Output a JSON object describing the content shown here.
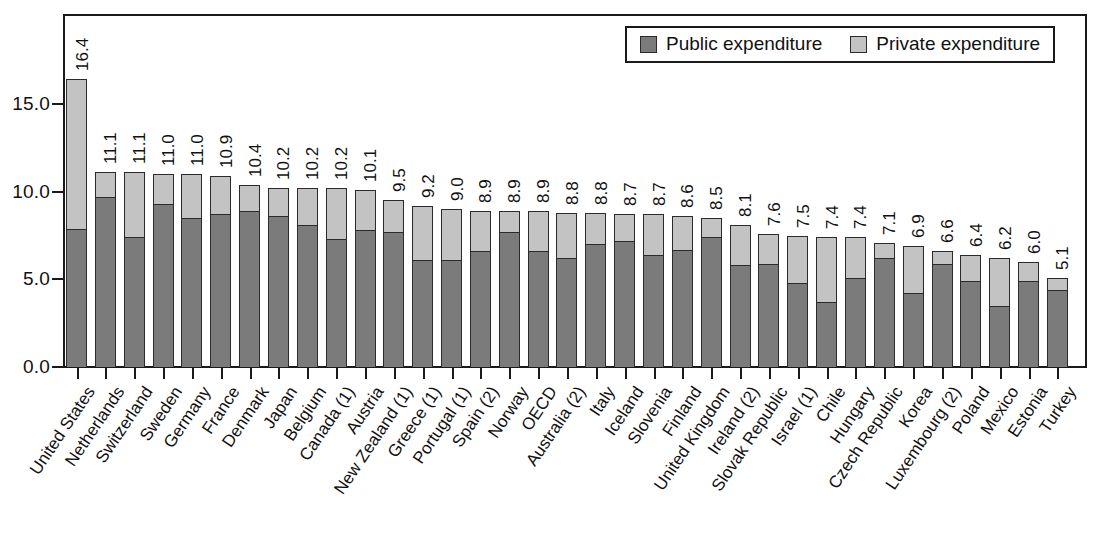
{
  "chart_data": {
    "type": "bar",
    "subtype": "stacked-vertical",
    "title": "",
    "xlabel": "",
    "ylabel": "",
    "ylim": [
      0,
      17.5
    ],
    "yticks": [
      "0.0",
      "5.0",
      "10.0",
      "15.0"
    ],
    "ytick_values": [
      0.0,
      5.0,
      10.0,
      15.0
    ],
    "grid": false,
    "legend_position": "top-right",
    "legend": [
      "Public expenditure",
      "Private expenditure"
    ],
    "colors": {
      "public": "#7b7b7b",
      "private": "#c3c3c3",
      "axis": "#1a1a1a",
      "text": "#111111",
      "background": "#ffffff"
    },
    "categories": [
      "United States",
      "Netherlands",
      "Switzerland",
      "Sweden",
      "Germany",
      "France",
      "Denmark",
      "Japan",
      "Belgium",
      "Canada (1)",
      "Austria",
      "New Zealand (1)",
      "Greece (1)",
      "Portugal (1)",
      "Spain (2)",
      "Norway",
      "OECD",
      "Australia (2)",
      "Italy",
      "Iceland",
      "Slovenia",
      "Finland",
      "United Kingdom",
      "Ireland (2)",
      "Slovak Republic",
      "Israel (1)",
      "Chile",
      "Hungary",
      "Czech Republic",
      "Korea",
      "Luxembourg (2)",
      "Poland",
      "Mexico",
      "Estonia",
      "Turkey"
    ],
    "totals": [
      16.4,
      11.1,
      11.1,
      11.0,
      11.0,
      10.9,
      10.4,
      10.2,
      10.2,
      10.2,
      10.1,
      9.5,
      9.2,
      9.0,
      8.9,
      8.9,
      8.9,
      8.8,
      8.8,
      8.7,
      8.7,
      8.6,
      8.5,
      8.1,
      7.6,
      7.5,
      7.4,
      7.4,
      7.1,
      6.9,
      6.6,
      6.4,
      6.2,
      6.0,
      5.1
    ],
    "series": [
      {
        "name": "Public expenditure",
        "values": [
          7.9,
          9.7,
          7.4,
          9.3,
          8.5,
          8.7,
          8.9,
          8.6,
          8.1,
          7.3,
          7.8,
          7.7,
          6.1,
          6.1,
          6.6,
          7.7,
          6.6,
          6.2,
          7.0,
          7.2,
          6.4,
          6.7,
          7.4,
          5.8,
          5.9,
          4.8,
          3.7,
          5.1,
          6.2,
          4.2,
          5.9,
          4.9,
          3.5,
          4.9,
          4.4
        ]
      },
      {
        "name": "Private expenditure",
        "values": [
          8.5,
          1.4,
          3.7,
          1.7,
          2.5,
          2.2,
          1.5,
          1.6,
          2.1,
          2.9,
          2.3,
          1.8,
          3.1,
          2.9,
          2.3,
          1.2,
          2.3,
          2.6,
          1.8,
          1.5,
          2.3,
          1.9,
          1.1,
          2.3,
          1.7,
          2.7,
          3.7,
          2.3,
          0.9,
          2.7,
          0.7,
          1.5,
          2.7,
          1.1,
          0.7
        ]
      }
    ],
    "data_labels": [
      "16.4",
      "11.1",
      "11.1",
      "11.0",
      "11.0",
      "10.9",
      "10.4",
      "10.2",
      "10.2",
      "10.2",
      "10.1",
      "9.5",
      "9.2",
      "9.0",
      "8.9",
      "8.9",
      "8.9",
      "8.8",
      "8.8",
      "8.7",
      "8.7",
      "8.6",
      "8.5",
      "8.1",
      "7.6",
      "7.5",
      "7.4",
      "7.4",
      "7.1",
      "6.9",
      "6.6",
      "6.4",
      "6.2",
      "6.0",
      "5.1"
    ]
  },
  "legend": {
    "items": [
      {
        "label": "Public expenditure",
        "swatch": "#7b7b7b"
      },
      {
        "label": "Private expenditure",
        "swatch": "#c3c3c3"
      }
    ]
  },
  "footnote": ""
}
